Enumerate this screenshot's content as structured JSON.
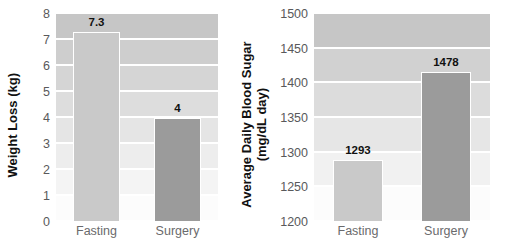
{
  "chart_data": [
    {
      "type": "bar",
      "panel": "left",
      "title": "",
      "ylabel": "Weight Loss (kg)",
      "xlabel": "",
      "categories": [
        "Fasting",
        "Surgery"
      ],
      "values": [
        7.3,
        4
      ],
      "value_labels": [
        "7.3",
        "4"
      ],
      "ylim": [
        0,
        8
      ],
      "yticks": [
        8,
        7,
        6,
        5,
        4,
        3,
        2,
        1,
        0
      ],
      "ytick_labels": [
        "8",
        "7",
        "6",
        "5",
        "4",
        "3",
        "2",
        "1",
        "0"
      ],
      "grid": true,
      "legend": "none",
      "bar_colors": [
        "#c9c9c9",
        "#9b9b9b"
      ]
    },
    {
      "type": "bar",
      "panel": "right",
      "title": "",
      "ylabel_line1": "Average Daily Blood Sugar",
      "ylabel_line2": "(mg/dL day)",
      "xlabel": "",
      "categories": [
        "Fasting",
        "Surgery"
      ],
      "values": [
        1293,
        1478
      ],
      "value_labels": [
        "1293",
        "1478"
      ],
      "drawn_values": [
        1289,
        1417
      ],
      "ylim": [
        1200,
        1500
      ],
      "yticks": [
        1500,
        1450,
        1400,
        1350,
        1300,
        1250,
        1200
      ],
      "ytick_labels": [
        "1500",
        "1450",
        "1400",
        "1350",
        "1300",
        "1250",
        "1200"
      ],
      "grid": true,
      "legend": "none",
      "bar_colors": [
        "#c9c9c9",
        "#9b9b9b"
      ]
    }
  ],
  "colors": {
    "bar_light": "#c9c9c9",
    "bar_dark": "#9b9b9b",
    "tick_text": "#59595b",
    "category_text": "#6a6a6c",
    "label_text": "#111111",
    "gridline": "#ffffff",
    "band_top": "#c6c6c6",
    "band_bottom": "#fcfcfc"
  }
}
